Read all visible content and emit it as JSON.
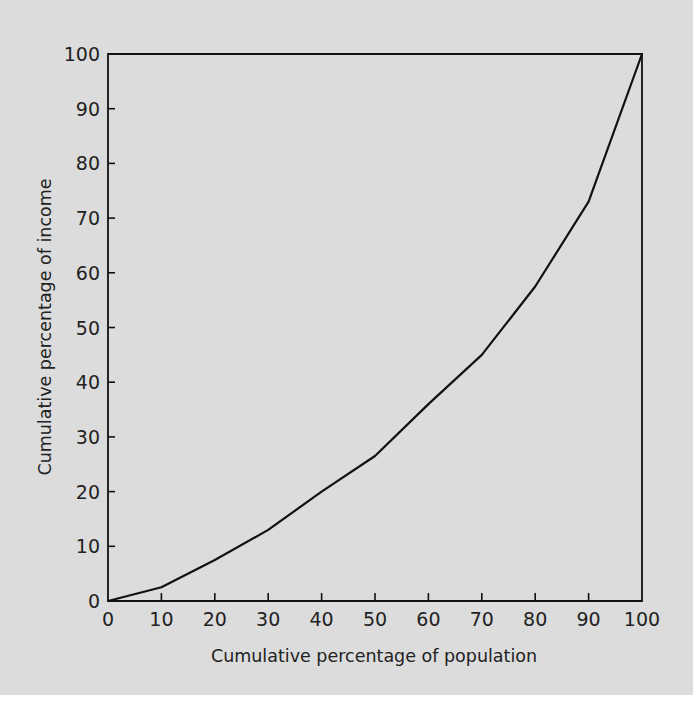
{
  "chart_data": {
    "type": "line",
    "title": "",
    "xlabel": "Cumulative percentage of population",
    "ylabel": "Cumulative percentage of income",
    "xlim": [
      0,
      100
    ],
    "ylim": [
      0,
      100
    ],
    "grid": false,
    "legend": null,
    "x_ticks": [
      0,
      10,
      20,
      30,
      40,
      50,
      60,
      70,
      80,
      90,
      100
    ],
    "y_ticks": [
      0,
      10,
      20,
      30,
      40,
      50,
      60,
      70,
      80,
      90,
      100
    ],
    "x": [
      0,
      10,
      20,
      30,
      40,
      50,
      60,
      70,
      80,
      90,
      100
    ],
    "series": [
      {
        "name": "Lorenz curve",
        "values": [
          0,
          2.5,
          7.5,
          13,
          20,
          26.5,
          36,
          45,
          57.5,
          73,
          100
        ]
      }
    ]
  },
  "colors": {
    "background": "#dcdcdc",
    "line": "#111111",
    "text": "#222222"
  }
}
